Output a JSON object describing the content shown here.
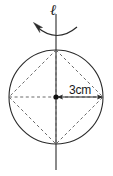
{
  "figure": {
    "axis_label": "ℓ",
    "dimension_label": "3cm",
    "rotation_arrow_direction": "counterclockwise",
    "colors": {
      "stroke": "#1a1a1a",
      "dashed_stroke": "#555555",
      "background": "#ffffff"
    },
    "geometry": {
      "circle": {
        "cx": 56,
        "cy": 97,
        "r": 47
      },
      "center_dot": {
        "cx": 56,
        "cy": 97,
        "r": 2.6
      },
      "axis_line": {
        "x": 56,
        "y1": 14,
        "y2": 170
      },
      "dimension_line": {
        "x1": 56,
        "y1": 97,
        "x2": 103,
        "y2": 97
      },
      "rhombus_vertices": [
        {
          "x": 56,
          "y": 50
        },
        {
          "x": 103,
          "y": 97
        },
        {
          "x": 56,
          "y": 144
        },
        {
          "x": 9,
          "y": 97
        }
      ],
      "diagonals": [
        {
          "x1": 9,
          "y1": 97,
          "x2": 103,
          "y2": 97
        },
        {
          "x1": 56,
          "y1": 50,
          "x2": 56,
          "y2": 144
        }
      ],
      "rotation_arc": {
        "x1": 36,
        "y1": 26,
        "x2": 77,
        "y2": 27,
        "sweep_y": 38
      }
    }
  }
}
